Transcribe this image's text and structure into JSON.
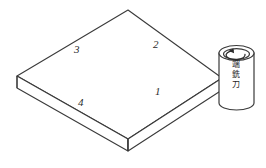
{
  "figure": {
    "type": "isometric-technical-drawing",
    "background_color": "#ffffff",
    "line_color": "#3a3a3a",
    "fill_color": "#ffffff"
  },
  "workpiece": {
    "name": "rectangular block",
    "edge_labels": [
      {
        "id": "1",
        "text": "1",
        "position": "front-right top edge"
      },
      {
        "id": "2",
        "text": "2",
        "position": "rear-right top edge"
      },
      {
        "id": "3",
        "text": "3",
        "position": "rear-left top edge"
      },
      {
        "id": "4",
        "text": "4",
        "position": "front-left top edge"
      }
    ]
  },
  "tool": {
    "name": "end mill cutter",
    "caption_lines": [
      "端",
      "銑",
      "刀"
    ],
    "caption_full": "端銑刀",
    "rotation_indicator": "curved-arrow-counterclockwise"
  }
}
